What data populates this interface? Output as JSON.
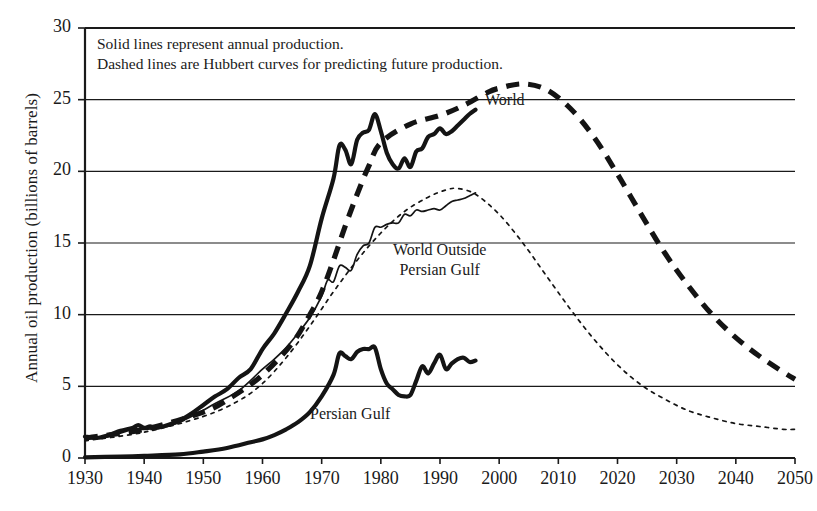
{
  "chart_data": {
    "type": "line",
    "title": "",
    "xlabel": "",
    "ylabel": "Annual oil production (billions of barrels)",
    "xlim": [
      1930,
      2050
    ],
    "ylim": [
      0,
      30
    ],
    "grid": true,
    "legend_position": "inline-annotations",
    "xticks": [
      "1930",
      "1940",
      "1950",
      "1960",
      "1970",
      "1980",
      "1990",
      "2000",
      "2010",
      "2020",
      "2030",
      "2040",
      "2050"
    ],
    "yticks": [
      "0",
      "5",
      "10",
      "15",
      "20",
      "25",
      "30"
    ],
    "annotations": [
      "Solid lines represent annual production.",
      "Dashed lines are Hubbert curves for predicting future production."
    ],
    "series": [
      {
        "name": "World",
        "style": "solid",
        "weight": "thick",
        "label": "World",
        "x": [
          1930,
          1932,
          1934,
          1936,
          1938,
          1939,
          1940,
          1941,
          1942,
          1944,
          1946,
          1948,
          1950,
          1952,
          1954,
          1956,
          1958,
          1960,
          1962,
          1964,
          1966,
          1968,
          1970,
          1972,
          1973,
          1974,
          1975,
          1976,
          1977,
          1978,
          1979,
          1980,
          1981,
          1982,
          1983,
          1984,
          1985,
          1986,
          1987,
          1988,
          1989,
          1990,
          1991,
          1992,
          1993,
          1994,
          1995,
          1996
        ],
        "y": [
          1.5,
          1.4,
          1.6,
          1.9,
          2.1,
          2.3,
          2.1,
          2.2,
          2.1,
          2.3,
          2.6,
          3.1,
          3.7,
          4.3,
          4.8,
          5.6,
          6.2,
          7.6,
          8.7,
          10.1,
          11.6,
          13.4,
          16.7,
          19.5,
          21.8,
          21.5,
          20.5,
          22.2,
          22.7,
          22.9,
          24.0,
          22.8,
          21.3,
          20.5,
          20.2,
          20.9,
          20.3,
          21.4,
          21.6,
          22.4,
          22.6,
          23.0,
          22.6,
          22.8,
          23.2,
          23.6,
          24.0,
          24.3
        ]
      },
      {
        "name": "World Hubbert",
        "style": "dashed",
        "weight": "thick",
        "label": "World",
        "x": [
          1930,
          1940,
          1950,
          1955,
          1960,
          1965,
          1968,
          1970,
          1972,
          1974,
          1976,
          1978,
          1980,
          1985,
          1990,
          1994,
          1998,
          2000,
          2004,
          2008,
          2012,
          2016,
          2020,
          2024,
          2028,
          2032,
          2036,
          2040,
          2044,
          2048,
          2050
        ],
        "y": [
          1.4,
          2.0,
          3.2,
          4.3,
          5.8,
          8.0,
          10.0,
          11.6,
          13.8,
          16.2,
          18.4,
          20.4,
          22.0,
          23.3,
          23.9,
          24.6,
          25.5,
          25.8,
          26.1,
          25.7,
          24.4,
          22.4,
          19.8,
          17.0,
          14.3,
          12.0,
          10.0,
          8.4,
          7.1,
          6.0,
          5.5
        ]
      },
      {
        "name": "World Outside Persian Gulf",
        "style": "solid",
        "weight": "thin",
        "label": "World Outside\nPersian Gulf",
        "x": [
          1930,
          1934,
          1938,
          1940,
          1944,
          1948,
          1952,
          1956,
          1960,
          1962,
          1964,
          1966,
          1968,
          1970,
          1971,
          1972,
          1973,
          1974,
          1975,
          1976,
          1977,
          1978,
          1979,
          1980,
          1981,
          1982,
          1983,
          1984,
          1985,
          1986,
          1987,
          1988,
          1989,
          1990,
          1991,
          1992,
          1993,
          1994,
          1995,
          1996
        ],
        "y": [
          1.4,
          1.5,
          2.0,
          2.0,
          2.2,
          2.9,
          3.8,
          4.7,
          6.2,
          6.9,
          7.7,
          8.7,
          9.8,
          11.3,
          12.4,
          12.3,
          13.4,
          13.3,
          13.1,
          14.2,
          14.8,
          15.0,
          16.1,
          16.1,
          16.3,
          16.4,
          16.4,
          17.0,
          16.9,
          17.3,
          17.2,
          17.3,
          17.4,
          17.3,
          17.6,
          17.9,
          18.0,
          18.1,
          18.3,
          18.5
        ]
      },
      {
        "name": "World Outside Persian Gulf Hubbert",
        "style": "dotted",
        "weight": "thin",
        "label": "",
        "x": [
          1930,
          1940,
          1950,
          1956,
          1960,
          1964,
          1968,
          1972,
          1976,
          1980,
          1984,
          1988,
          1991,
          1993,
          1996,
          2000,
          2004,
          2008,
          2012,
          2016,
          2020,
          2024,
          2028,
          2032,
          2036,
          2040,
          2044,
          2048,
          2050
        ],
        "y": [
          1.2,
          1.8,
          2.9,
          4.0,
          5.2,
          7.0,
          9.2,
          11.6,
          13.8,
          15.7,
          17.2,
          18.2,
          18.7,
          18.8,
          18.4,
          17.0,
          15.0,
          12.7,
          10.4,
          8.3,
          6.5,
          5.1,
          4.1,
          3.3,
          2.8,
          2.4,
          2.2,
          2.0,
          2.0
        ]
      },
      {
        "name": "Persian Gulf",
        "style": "solid",
        "weight": "thick",
        "label": "Persian Gulf",
        "x": [
          1930,
          1936,
          1940,
          1946,
          1950,
          1954,
          1958,
          1960,
          1962,
          1964,
          1966,
          1968,
          1970,
          1972,
          1973,
          1974,
          1975,
          1976,
          1977,
          1978,
          1979,
          1980,
          1981,
          1982,
          1983,
          1984,
          1985,
          1986,
          1987,
          1988,
          1989,
          1990,
          1991,
          1992,
          1993,
          1994,
          1995,
          1996
        ],
        "y": [
          0.05,
          0.1,
          0.15,
          0.25,
          0.45,
          0.7,
          1.1,
          1.3,
          1.6,
          2.0,
          2.5,
          3.2,
          4.3,
          5.8,
          7.3,
          7.1,
          6.9,
          7.4,
          7.6,
          7.6,
          7.7,
          6.2,
          5.2,
          4.8,
          4.4,
          4.3,
          4.4,
          5.4,
          6.4,
          5.9,
          6.6,
          7.2,
          6.2,
          6.6,
          6.9,
          7.0,
          6.7,
          6.8
        ]
      }
    ]
  }
}
